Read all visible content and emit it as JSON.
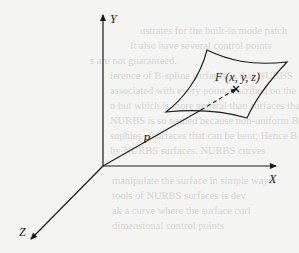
{
  "figure": {
    "axes": {
      "x_label": "X",
      "y_label": "Y",
      "z_label": "Z"
    },
    "vector_label": "P",
    "point_label": "F (x, y, z)",
    "elements": [
      "3D coordinate axes",
      "curved surface patch",
      "position vector P from origin to point F on surface (dashed behind surface)"
    ],
    "line_color": "#1b1b1b",
    "background_color": "#f4f4f2"
  },
  "bleed_through_text": [
    "ustrates for the built-in mode patch",
    "It also have several control points",
    "s are not guaranteed.",
    "ierence of B-spline surfaces is that NURBS",
    "associated with every point described on the",
    "n but which is more general than surfaces that",
    "NURBS is so named because non-uniform B",
    "sophies—surfaces that can be bent; Hence B",
    "by NURBS surfaces. NURBS curves",
    "manipulate the surface in simple ways",
    "tools of NURBS surfaces is dev",
    "ak a curve where the surface curl",
    "dimensional control points"
  ]
}
